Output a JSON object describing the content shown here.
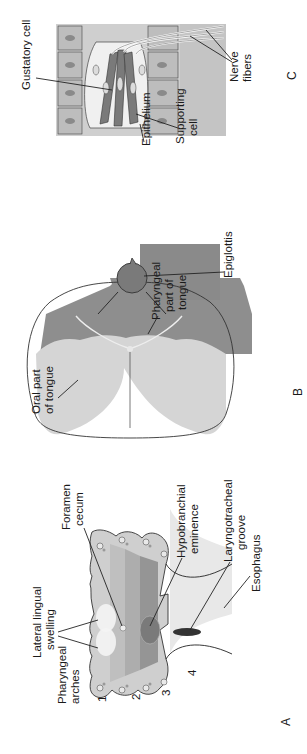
{
  "figure": {
    "orientation": "rotated-90-ccw",
    "panels": [
      {
        "id": "A",
        "letter": "A",
        "labels": {
          "pharyngeal_arches_1": "Pharyngeal",
          "pharyngeal_arches_2": "arches",
          "lateral_lingual_1": "Lateral lingual",
          "lateral_lingual_2": "swelling",
          "foramen_cecum_1": "Foramen",
          "foramen_cecum_2": "cecum",
          "hypobranchial_1": "Hypobranchial",
          "hypobranchial_2": "eminence",
          "laryngotracheal_1": "Laryngotracheal",
          "laryngotracheal_2": "groove",
          "esophagus": "Esophagus",
          "arch_numbers": [
            "1",
            "2",
            "3",
            "4"
          ]
        }
      },
      {
        "id": "B",
        "letter": "B",
        "labels": {
          "oral_part_1": "Oral part",
          "oral_part_2": "of tongue",
          "pharyngeal_part_1": "Pharyngeal",
          "pharyngeal_part_2": "part of",
          "pharyngeal_part_3": "tongue",
          "epiglottis": "Epiglottis"
        }
      },
      {
        "id": "C",
        "letter": "C",
        "labels": {
          "gustatory_cell": "Gustatory cell",
          "epithelium": "Epithelium",
          "supporting_cell_1": "Supporting",
          "supporting_cell_2": "cell",
          "nerve_fibers_1": "Nerve",
          "nerve_fibers_2": "fibers"
        }
      }
    ],
    "colors": {
      "light_gray": "#d9d9d9",
      "mid_gray": "#bdbdbd",
      "dark_gray": "#8e8e8e",
      "darker_gray": "#6f6f6f",
      "outline": "#333333"
    }
  }
}
